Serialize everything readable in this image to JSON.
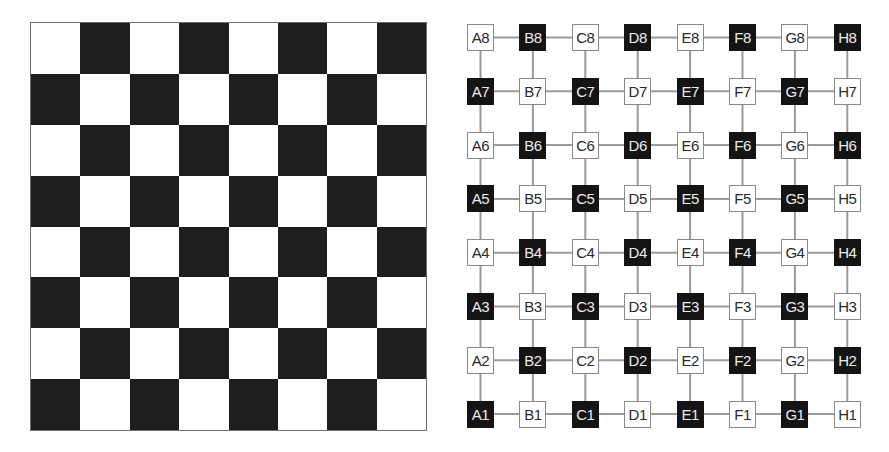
{
  "colors": {
    "dark": "#1e1e1e",
    "light": "#ffffff",
    "edge": "#9a9a9a",
    "border": "#6e6e6e"
  },
  "board": {
    "rows": 8,
    "cols": 8,
    "top_left_color": "light",
    "squares": [
      [
        "light",
        "dark",
        "light",
        "dark",
        "light",
        "dark",
        "light",
        "dark"
      ],
      [
        "dark",
        "light",
        "dark",
        "light",
        "dark",
        "light",
        "dark",
        "light"
      ],
      [
        "light",
        "dark",
        "light",
        "dark",
        "light",
        "dark",
        "light",
        "dark"
      ],
      [
        "dark",
        "light",
        "dark",
        "light",
        "dark",
        "light",
        "dark",
        "light"
      ],
      [
        "light",
        "dark",
        "light",
        "dark",
        "light",
        "dark",
        "light",
        "dark"
      ],
      [
        "dark",
        "light",
        "dark",
        "light",
        "dark",
        "light",
        "dark",
        "light"
      ],
      [
        "light",
        "dark",
        "light",
        "dark",
        "light",
        "dark",
        "light",
        "dark"
      ],
      [
        "dark",
        "light",
        "dark",
        "light",
        "dark",
        "light",
        "dark",
        "light"
      ]
    ]
  },
  "graph": {
    "files": [
      "A",
      "B",
      "C",
      "D",
      "E",
      "F",
      "G",
      "H"
    ],
    "ranks": [
      "8",
      "7",
      "6",
      "5",
      "4",
      "3",
      "2",
      "1"
    ],
    "edges": "grid-4-neighbour",
    "nodes": [
      [
        {
          "label": "A8",
          "color": "light"
        },
        {
          "label": "B8",
          "color": "dark"
        },
        {
          "label": "C8",
          "color": "light"
        },
        {
          "label": "D8",
          "color": "dark"
        },
        {
          "label": "E8",
          "color": "light"
        },
        {
          "label": "F8",
          "color": "dark"
        },
        {
          "label": "G8",
          "color": "light"
        },
        {
          "label": "H8",
          "color": "dark"
        }
      ],
      [
        {
          "label": "A7",
          "color": "dark"
        },
        {
          "label": "B7",
          "color": "light"
        },
        {
          "label": "C7",
          "color": "dark"
        },
        {
          "label": "D7",
          "color": "light"
        },
        {
          "label": "E7",
          "color": "dark"
        },
        {
          "label": "F7",
          "color": "light"
        },
        {
          "label": "G7",
          "color": "dark"
        },
        {
          "label": "H7",
          "color": "light"
        }
      ],
      [
        {
          "label": "A6",
          "color": "light"
        },
        {
          "label": "B6",
          "color": "dark"
        },
        {
          "label": "C6",
          "color": "light"
        },
        {
          "label": "D6",
          "color": "dark"
        },
        {
          "label": "E6",
          "color": "light"
        },
        {
          "label": "F6",
          "color": "dark"
        },
        {
          "label": "G6",
          "color": "light"
        },
        {
          "label": "H6",
          "color": "dark"
        }
      ],
      [
        {
          "label": "A5",
          "color": "dark"
        },
        {
          "label": "B5",
          "color": "light"
        },
        {
          "label": "C5",
          "color": "dark"
        },
        {
          "label": "D5",
          "color": "light"
        },
        {
          "label": "E5",
          "color": "dark"
        },
        {
          "label": "F5",
          "color": "light"
        },
        {
          "label": "G5",
          "color": "dark"
        },
        {
          "label": "H5",
          "color": "light"
        }
      ],
      [
        {
          "label": "A4",
          "color": "light"
        },
        {
          "label": "B4",
          "color": "dark"
        },
        {
          "label": "C4",
          "color": "light"
        },
        {
          "label": "D4",
          "color": "dark"
        },
        {
          "label": "E4",
          "color": "light"
        },
        {
          "label": "F4",
          "color": "dark"
        },
        {
          "label": "G4",
          "color": "light"
        },
        {
          "label": "H4",
          "color": "dark"
        }
      ],
      [
        {
          "label": "A3",
          "color": "dark"
        },
        {
          "label": "B3",
          "color": "light"
        },
        {
          "label": "C3",
          "color": "dark"
        },
        {
          "label": "D3",
          "color": "light"
        },
        {
          "label": "E3",
          "color": "dark"
        },
        {
          "label": "F3",
          "color": "light"
        },
        {
          "label": "G3",
          "color": "dark"
        },
        {
          "label": "H3",
          "color": "light"
        }
      ],
      [
        {
          "label": "A2",
          "color": "light"
        },
        {
          "label": "B2",
          "color": "dark"
        },
        {
          "label": "C2",
          "color": "light"
        },
        {
          "label": "D2",
          "color": "dark"
        },
        {
          "label": "E2",
          "color": "light"
        },
        {
          "label": "F2",
          "color": "dark"
        },
        {
          "label": "G2",
          "color": "light"
        },
        {
          "label": "H2",
          "color": "dark"
        }
      ],
      [
        {
          "label": "A1",
          "color": "dark"
        },
        {
          "label": "B1",
          "color": "light"
        },
        {
          "label": "C1",
          "color": "dark"
        },
        {
          "label": "D1",
          "color": "light"
        },
        {
          "label": "E1",
          "color": "dark"
        },
        {
          "label": "F1",
          "color": "light"
        },
        {
          "label": "G1",
          "color": "dark"
        },
        {
          "label": "H1",
          "color": "light"
        }
      ]
    ]
  }
}
